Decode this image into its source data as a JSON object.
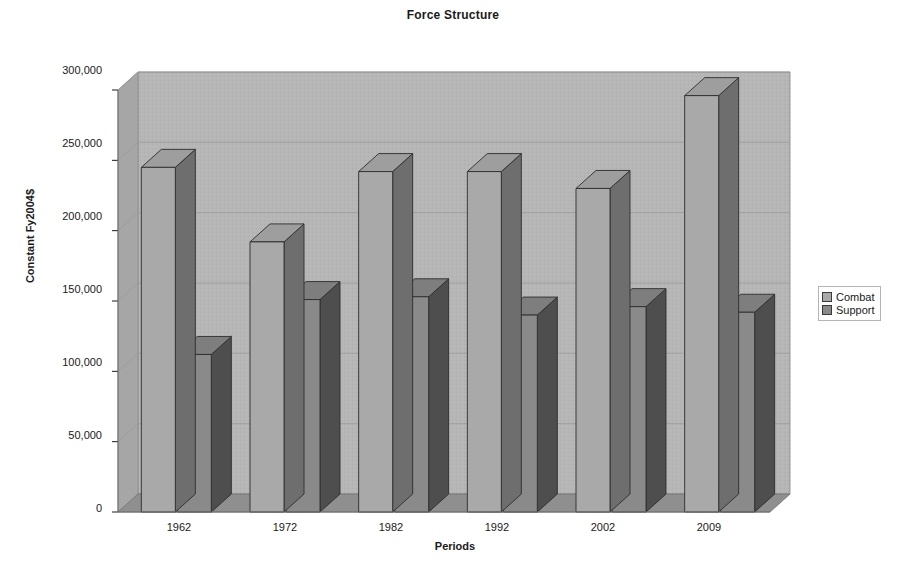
{
  "chart_data": {
    "type": "bar",
    "title": "Force Structure",
    "xlabel": "Periods",
    "ylabel": "Constant Fy2004$",
    "categories": [
      "1962",
      "1972",
      "1982",
      "1992",
      "2002",
      "2009"
    ],
    "series": [
      {
        "name": "Combat",
        "color": "#a9a9a9",
        "values": [
          245000,
          192000,
          242000,
          242000,
          230000,
          296000
        ]
      },
      {
        "name": "Support",
        "color": "#8a8a8a",
        "values": [
          112000,
          151000,
          153000,
          140000,
          146000,
          142000
        ]
      }
    ],
    "ylim": [
      0,
      300000
    ],
    "ytick_labels": [
      "0",
      "50,000",
      "100,000",
      "150,000",
      "200,000",
      "250,000",
      "300,000"
    ],
    "ytick_values": [
      0,
      50000,
      100000,
      150000,
      200000,
      250000,
      300000
    ],
    "grid": true,
    "legend_position": "right",
    "projection": "3d",
    "plot_background": "#b6b6b6",
    "floor_color": "#8f8f8f"
  },
  "legend": {
    "entries": [
      {
        "label": "Combat",
        "swatch_color": "#a9a9a9"
      },
      {
        "label": "Support",
        "swatch_color": "#8a8a8a"
      }
    ]
  }
}
